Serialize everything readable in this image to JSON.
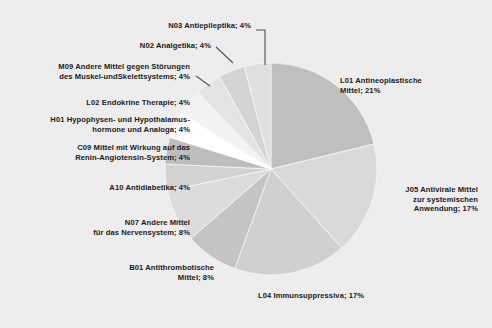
{
  "chart_data": {
    "type": "pie",
    "title": "",
    "subtitle": "",
    "xlabel": "",
    "ylabel": "",
    "legend_position": "none",
    "grid": false,
    "labels_format": "name; percent",
    "background_color": "#ededed",
    "categories": [
      "L01 Antineoplastische Mittel",
      "J05 Antivirale Mittel zur systemischen Anwendung",
      "L04 Immunsuppressiva",
      "B01 Antithrombotische Mittel",
      "N07 Andere Mittel für das Nervensystem",
      "A10 Antidiabetika",
      "C09 Mittel mit Wirkung auf das Renin-Angiotensin-System",
      "H01 Hypophysen- und Hypothalamushormone und Analoga",
      "L02 Endokrine Therapie",
      "M09 Andere Mittel gegen Störungen des Muskel-undSkelettsystems",
      "N02 Analgetika",
      "N03 Antiepileptika"
    ],
    "values": [
      21,
      17,
      17,
      8,
      8,
      4,
      4,
      4,
      4,
      4,
      4,
      4
    ],
    "unit": "%",
    "slice_colors": [
      "#bfbfbf",
      "#d9d9d9",
      "#d0d0d0",
      "#c4c4c4",
      "#dcdcdc",
      "#d2d2d2",
      "#bdbdbd",
      "#ffffff",
      "#f2f2f2",
      "#e4e4e4",
      "#d4d4d4",
      "#e0e0e0"
    ]
  },
  "labels": {
    "l01": "L01 Antineoplastische\nMittel; 21%",
    "j05": "J05 Antivirale Mittel\nzur systemischen\nAnwendung; 17%",
    "l04": "L04 Immunsuppressiva; 17%",
    "b01": "B01 Antithrombotische\nMittel; 8%",
    "n07": "N07 Andere Mittel\nfür das Nervensystem; 8%",
    "a10": "A10 Antidiabetika; 4%",
    "c09": "C09 Mittel mit Wirkung auf das\nRenin-Angiotensin-System; 4%",
    "h01": "H01 Hypophysen- und Hypothalamus-\nhormone und Analoga; 4%",
    "l02": "L02 Endokrine Therapie; 4%",
    "m09": "M09 Andere Mittel gegen Störungen\ndes Muskel-undSkelettsystems; 4%",
    "n02": "N02 Analgetika; 4%",
    "n03": "N03 Antiepileptika; 4%"
  }
}
